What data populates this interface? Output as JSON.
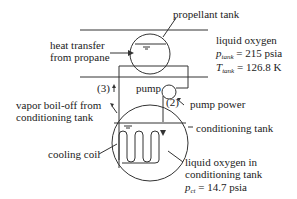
{
  "diagram": {
    "labels": {
      "propellant_tank": "propellant tank",
      "heat_transfer_line1": "heat transfer",
      "heat_transfer_line2": "from propane",
      "liquid_oxygen": "liquid oxygen",
      "p_tank_symbol": "p",
      "p_tank_sub": "tank",
      "p_tank_value": " = 215 psia",
      "t_tank_symbol": "T",
      "t_tank_sub": "tank",
      "t_tank_value": " = 126.8 K",
      "pump": "pump",
      "pump_power": "pump power",
      "stream_3": "(3)",
      "stream_2": "(2)",
      "vapor_line1": "vapor boil-off from",
      "vapor_line2": "conditioning tank",
      "conditioning_tank": "conditioning tank",
      "cooling_coil": "cooling coil",
      "lox_ct_line1": "liquid oxygen in",
      "lox_ct_line2": "conditioning tank",
      "p_ct_symbol": "p",
      "p_ct_sub": "ct",
      "p_ct_value": " = 14.7 psia"
    },
    "colors": {
      "line": "#333333",
      "text": "#222222"
    }
  }
}
